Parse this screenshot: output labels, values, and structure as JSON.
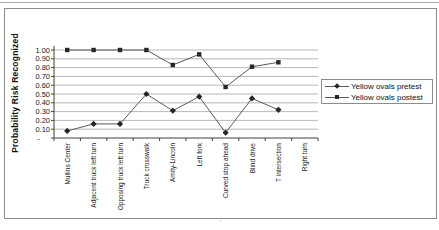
{
  "chart_data": {
    "type": "line",
    "title": "",
    "xlabel": "",
    "ylabel": "Probability Risk Recognized",
    "categories": [
      "Mullins Center",
      "Adjacent truck left turn",
      "Opposing truck left turn",
      "Truck crosswalk",
      "Amity-Lincoln",
      "Left fork",
      "Curved stop ahead",
      "Blind drive",
      "T intersection",
      "Right turn"
    ],
    "series": [
      {
        "name": "Yellow ovals pretest",
        "marker": "diamond",
        "values": [
          0.08,
          0.16,
          0.16,
          0.5,
          0.31,
          0.47,
          0.06,
          0.45,
          0.32,
          null
        ]
      },
      {
        "name": "Yellow ovals postest",
        "marker": "square",
        "values": [
          1.0,
          1.0,
          1.0,
          1.0,
          0.83,
          0.95,
          0.58,
          0.81,
          0.86,
          null
        ]
      }
    ],
    "ylim": [
      0,
      1.0
    ],
    "ytick_step": 0.1,
    "y_tick_labels": [
      "1.00",
      "0.90",
      "0.80",
      "0.70",
      "0.60",
      "0.50",
      "0.40",
      "0.30",
      "0.20",
      "0.10",
      "-"
    ],
    "grid": true,
    "legend_position": "right",
    "colors": {
      "line": "#595959",
      "marker": "#262626",
      "gridline": "#a6a6a6",
      "axis": "#404040",
      "text": "#1a1a1a"
    }
  },
  "footnote_mark": "'"
}
